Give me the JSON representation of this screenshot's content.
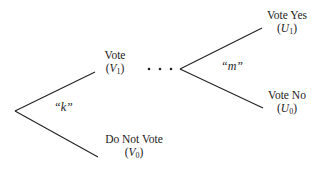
{
  "diagram": {
    "type": "decision-tree",
    "nodes": {
      "vote": {
        "label": "Vote",
        "symbol": "V",
        "subscript": "1"
      },
      "do_not_vote": {
        "label": "Do Not Vote",
        "symbol": "V",
        "subscript": "0"
      },
      "vote_yes": {
        "label": "Vote Yes",
        "symbol": "U",
        "subscript": "1"
      },
      "vote_no": {
        "label": "Vote No",
        "symbol": "U",
        "subscript": "0"
      }
    },
    "edges": {
      "first_choice": "“k”",
      "second_choice": "“m”"
    },
    "ellipsis": "• • •",
    "line_color": "#222222"
  }
}
